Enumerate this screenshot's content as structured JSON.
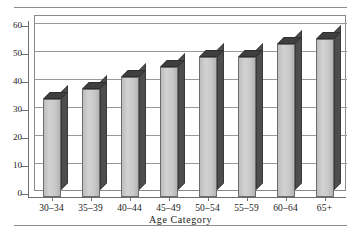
{
  "figure": {
    "style": "3d-column-chart",
    "has_top_rule": true,
    "has_bottom_rule": true,
    "bar_face_color": "#c9c9c9",
    "bar_top_color": "#3f3f3f",
    "bar_side_color": "#4d4d4d",
    "frame_color": "#8a8a8a",
    "grid_color": "#9a9a9a"
  },
  "chart_data": {
    "type": "bar",
    "title": "",
    "xlabel": "Age Category",
    "ylabel": "",
    "categories": [
      "30–34",
      "35–39",
      "40–44",
      "45–49",
      "50–54",
      "55–59",
      "60–64",
      "65+"
    ],
    "values": [
      35,
      38.5,
      43,
      46.5,
      50,
      50,
      54.5,
      56.5
    ],
    "ylim": [
      0,
      60
    ],
    "yticks": [
      0,
      10,
      20,
      30,
      40,
      50,
      60
    ],
    "ytick_labels": [
      "0",
      "10",
      "20",
      "30",
      "40",
      "50",
      "60"
    ],
    "grid": "horizontal",
    "legend": "none"
  }
}
